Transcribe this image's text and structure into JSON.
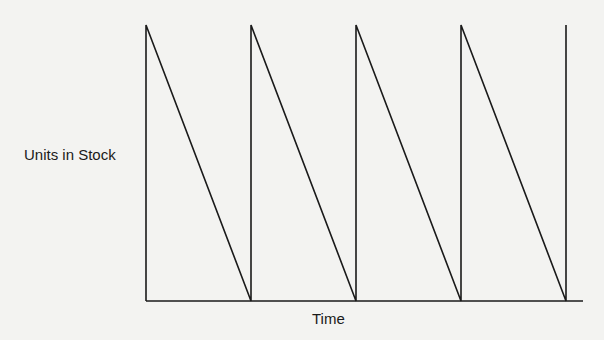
{
  "chart_data": {
    "type": "line",
    "title": "",
    "xlabel": "Time",
    "ylabel": "Units in Stock",
    "series": [
      {
        "name": "Units in Stock",
        "x": [
          0,
          0,
          1,
          1,
          2,
          2,
          3,
          3,
          4,
          4
        ],
        "y": [
          0,
          1,
          0,
          1,
          0,
          1,
          0,
          1,
          0,
          1
        ]
      }
    ],
    "cycles": 4,
    "xlim": [
      0,
      4.16
    ],
    "ylim": [
      0,
      1
    ],
    "grid": false,
    "legend": "none",
    "tick_labels": false
  }
}
